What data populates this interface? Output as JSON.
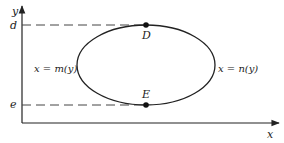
{
  "diagram": {
    "axes": {
      "x_label": "x",
      "y_label": "y"
    },
    "levels": {
      "top": "d",
      "bottom": "e"
    },
    "points": {
      "top": "D",
      "bottom": "E"
    },
    "curves": {
      "left": "x = m(y)",
      "right": "x = n(y)"
    },
    "colors": {
      "stroke": "#222222",
      "dash": "#444444"
    }
  }
}
